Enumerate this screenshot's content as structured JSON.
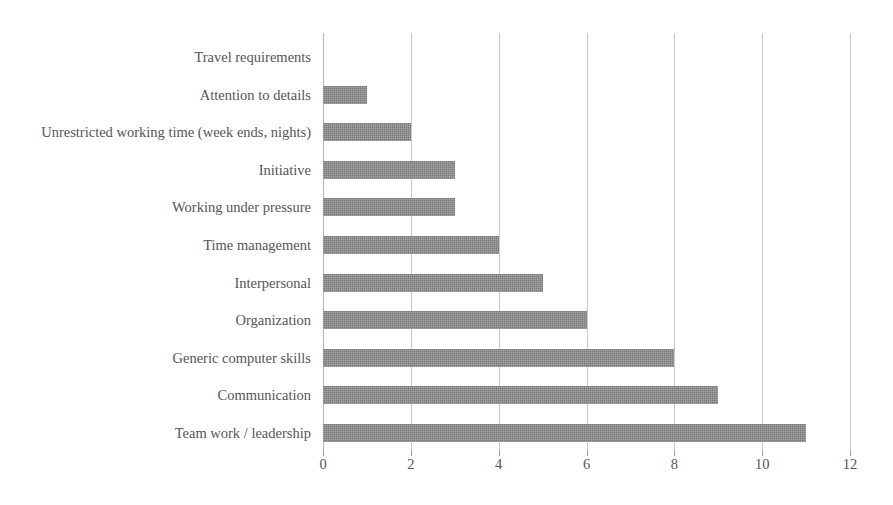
{
  "chart_data": {
    "type": "bar",
    "orientation": "horizontal",
    "title": "",
    "subtitle": "",
    "xlabel": "",
    "ylabel": "",
    "xlim": [
      0,
      12
    ],
    "xticks": [
      0,
      2,
      4,
      6,
      8,
      10,
      12
    ],
    "xtick_labels": [
      "0",
      "2",
      "4",
      "6",
      "8",
      "10",
      "12"
    ],
    "grid": "vertical",
    "legend": "none",
    "bar_color": "#7b7b7b",
    "gridline_color": "#c9c9c9",
    "text_color": "#555555",
    "categories": [
      "Travel requirements",
      "Attention to details",
      "Unrestricted working time (week ends, nights)",
      "Initiative",
      "Working under pressure",
      "Time management",
      "Interpersonal",
      "Organization",
      "Generic computer skills",
      "Communication",
      "Team work / leadership"
    ],
    "values": [
      0,
      1,
      2,
      3,
      3,
      4,
      5,
      6,
      8,
      9,
      11
    ],
    "series": [
      {
        "name": "",
        "values": [
          0,
          1,
          2,
          3,
          3,
          4,
          5,
          6,
          8,
          9,
          11
        ]
      }
    ]
  }
}
